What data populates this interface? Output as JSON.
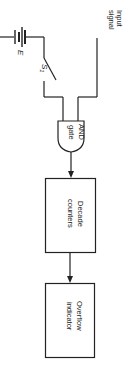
{
  "diagram": {
    "orientation": "rotated-90-clockwise",
    "battery": {
      "label": "E"
    },
    "switch": {
      "label": "S",
      "subscript": "1"
    },
    "input": {
      "label_line1": "Input",
      "label_line2": "signal"
    },
    "gate": {
      "label_line1": "AND",
      "label_line2": "gate"
    },
    "blocks": [
      {
        "label_line1": "Decade",
        "label_line2": "counters"
      },
      {
        "label_line1": "Overflow",
        "label_line2": "indicator"
      }
    ],
    "colors": {
      "line": "#222222",
      "background": "#ffffff"
    }
  }
}
